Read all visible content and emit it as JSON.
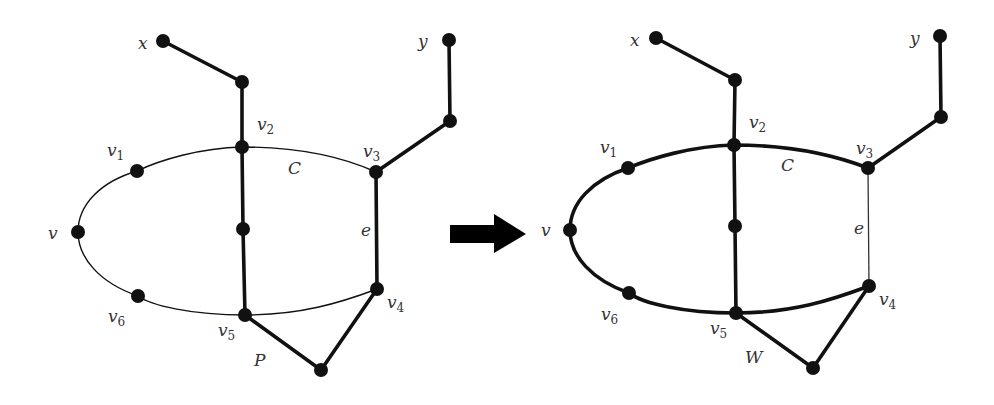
{
  "diagram": {
    "arrow": {
      "from": [
        450,
        233
      ],
      "to": [
        526,
        233
      ],
      "color": "#000000"
    },
    "left_graph": {
      "name": "before",
      "labels": {
        "x": "x",
        "y": "y",
        "v": "v",
        "v1": "v",
        "v1_sub": "1",
        "v2": "v",
        "v2_sub": "2",
        "v3": "v",
        "v3_sub": "3",
        "v4": "v",
        "v4_sub": "4",
        "v5": "v",
        "v5_sub": "5",
        "v6": "v",
        "v6_sub": "6",
        "cycle": "C",
        "edge": "e",
        "path": "P"
      },
      "nodes": {
        "x": [
          163,
          41
        ],
        "xn": [
          242,
          82
        ],
        "v2": [
          242,
          147
        ],
        "v1": [
          137,
          171
        ],
        "v": [
          78,
          232
        ],
        "mid": [
          243,
          229
        ],
        "v6": [
          138,
          296
        ],
        "v5": [
          245,
          315
        ],
        "v3": [
          376,
          172
        ],
        "y": [
          449,
          40
        ],
        "yn": [
          450,
          121
        ],
        "v4": [
          377,
          289
        ],
        "p": [
          321,
          370
        ]
      },
      "thick_edges": [
        [
          "x",
          "xn"
        ],
        [
          "xn",
          "v2"
        ],
        [
          "v2",
          "mid"
        ],
        [
          "mid",
          "v5"
        ],
        [
          "v3",
          "yn"
        ],
        [
          "yn",
          "y"
        ],
        [
          "v3",
          "v4"
        ],
        [
          "v5",
          "p"
        ],
        [
          "p",
          "v4"
        ]
      ],
      "thin_cycle": true
    },
    "right_graph": {
      "name": "after",
      "labels": {
        "x": "x",
        "y": "y",
        "v": "v",
        "v1": "v",
        "v1_sub": "1",
        "v2": "v",
        "v2_sub": "2",
        "v3": "v",
        "v3_sub": "3",
        "v4": "v",
        "v4_sub": "4",
        "v5": "v",
        "v5_sub": "5",
        "v6": "v",
        "v6_sub": "6",
        "cycle": "C",
        "edge": "e",
        "path": "W"
      },
      "nodes": {
        "x": [
          656,
          38
        ],
        "xn": [
          735,
          80
        ],
        "v2": [
          734,
          145
        ],
        "v1": [
          628,
          168
        ],
        "v": [
          570,
          230
        ],
        "mid": [
          735,
          226
        ],
        "v6": [
          629,
          293
        ],
        "v5": [
          736,
          313
        ],
        "v3": [
          868,
          168
        ],
        "y": [
          940,
          36
        ],
        "yn": [
          941,
          117
        ],
        "v4": [
          869,
          286
        ],
        "w": [
          813,
          368
        ]
      },
      "thick_edges": [
        [
          "x",
          "xn"
        ],
        [
          "xn",
          "v2"
        ],
        [
          "v2",
          "mid"
        ],
        [
          "mid",
          "v5"
        ],
        [
          "v3",
          "yn"
        ],
        [
          "yn",
          "y"
        ],
        [
          "v5",
          "w"
        ],
        [
          "w",
          "v4"
        ]
      ],
      "thin_edges": [
        [
          "v3",
          "v4"
        ]
      ],
      "thick_cycle": true
    }
  }
}
